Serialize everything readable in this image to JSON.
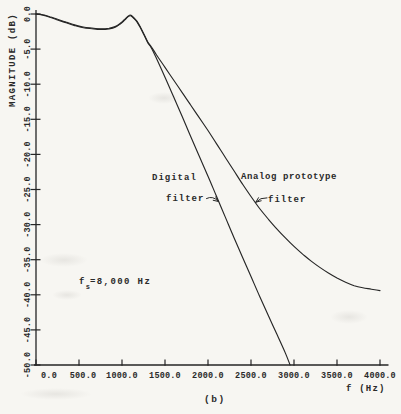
{
  "figure": {
    "caption": "(b)",
    "background": "#f7f6f2",
    "ink": "#262626"
  },
  "chart_data": {
    "type": "line",
    "title": "",
    "xlabel": "f (Hz)",
    "ylabel": "MAGNITUDE (dB)",
    "xlim": [
      0,
      4000
    ],
    "ylim": [
      -50,
      0
    ],
    "grid": false,
    "legend_position": "none",
    "x_ticks": [
      0,
      500,
      1000,
      1500,
      2000,
      2500,
      3000,
      3500,
      4000
    ],
    "x_tick_labels": [
      "0.0",
      "500.0",
      "1000.0",
      "1500.0",
      "2000.0",
      "2500.0",
      "3000.0",
      "3500.0",
      "4000.0"
    ],
    "y_ticks": [
      0,
      -5,
      -10,
      -15,
      -20,
      -25,
      -30,
      -35,
      -40,
      -45,
      -50
    ],
    "y_tick_labels": [
      "0.0",
      "-5.0",
      "-10.0",
      "-15.0",
      "-20.0",
      "-25.0",
      "-30.0",
      "-35.0",
      "-40.0",
      "-45.0",
      "-50.0"
    ],
    "sampling_label": {
      "pre": "f",
      "sub": "s",
      "post": "=8,000 Hz"
    },
    "annotations": {
      "digital_lines": [
        "Digital",
        "filter"
      ],
      "analog_lines": [
        "Analog prototype",
        "filter"
      ]
    },
    "series": [
      {
        "name": "Digital filter",
        "points": [
          [
            0,
            0
          ],
          [
            80,
            -0.15
          ],
          [
            160,
            -0.45
          ],
          [
            250,
            -0.85
          ],
          [
            350,
            -1.25
          ],
          [
            450,
            -1.65
          ],
          [
            550,
            -1.95
          ],
          [
            650,
            -2.1
          ],
          [
            750,
            -2.2
          ],
          [
            850,
            -2.12
          ],
          [
            920,
            -1.9
          ],
          [
            980,
            -1.42
          ],
          [
            1030,
            -0.88
          ],
          [
            1070,
            -0.4
          ],
          [
            1100,
            -0.25
          ],
          [
            1135,
            -0.6
          ],
          [
            1175,
            -1.15
          ],
          [
            1215,
            -2.0
          ],
          [
            1260,
            -3.1
          ],
          [
            1300,
            -4.1
          ],
          [
            1340,
            -4.8
          ],
          [
            1400,
            -6.3
          ],
          [
            1500,
            -9.0
          ],
          [
            1600,
            -11.8
          ],
          [
            1700,
            -14.6
          ],
          [
            1800,
            -17.5
          ],
          [
            1900,
            -20.3
          ],
          [
            2000,
            -23.1
          ],
          [
            2100,
            -26.0
          ],
          [
            2200,
            -28.9
          ],
          [
            2300,
            -31.8
          ],
          [
            2400,
            -34.6
          ],
          [
            2500,
            -37.4
          ],
          [
            2600,
            -40.2
          ],
          [
            2700,
            -42.9
          ],
          [
            2800,
            -45.6
          ],
          [
            2900,
            -48.3
          ],
          [
            2955,
            -50.0
          ]
        ]
      },
      {
        "name": "Analog prototype filter",
        "points": [
          [
            0,
            0
          ],
          [
            80,
            -0.1
          ],
          [
            160,
            -0.38
          ],
          [
            250,
            -0.75
          ],
          [
            350,
            -1.15
          ],
          [
            450,
            -1.55
          ],
          [
            550,
            -1.85
          ],
          [
            650,
            -2.0
          ],
          [
            750,
            -2.1
          ],
          [
            850,
            -2.02
          ],
          [
            920,
            -1.8
          ],
          [
            980,
            -1.32
          ],
          [
            1030,
            -0.78
          ],
          [
            1070,
            -0.32
          ],
          [
            1100,
            -0.15
          ],
          [
            1135,
            -0.5
          ],
          [
            1175,
            -1.05
          ],
          [
            1215,
            -1.9
          ],
          [
            1260,
            -3.0
          ],
          [
            1300,
            -4.0
          ],
          [
            1340,
            -4.65
          ],
          [
            1400,
            -5.8
          ],
          [
            1500,
            -7.6
          ],
          [
            1600,
            -9.4
          ],
          [
            1700,
            -11.2
          ],
          [
            1800,
            -13.0
          ],
          [
            1900,
            -14.8
          ],
          [
            2000,
            -16.6
          ],
          [
            2100,
            -18.5
          ],
          [
            2200,
            -20.4
          ],
          [
            2300,
            -22.3
          ],
          [
            2400,
            -24.2
          ],
          [
            2500,
            -26.0
          ],
          [
            2600,
            -27.7
          ],
          [
            2700,
            -29.2
          ],
          [
            2800,
            -30.6
          ],
          [
            2900,
            -31.9
          ],
          [
            3000,
            -33.1
          ],
          [
            3100,
            -34.2
          ],
          [
            3200,
            -35.2
          ],
          [
            3300,
            -36.1
          ],
          [
            3400,
            -36.9
          ],
          [
            3500,
            -37.6
          ],
          [
            3600,
            -38.2
          ],
          [
            3700,
            -38.7
          ],
          [
            3800,
            -39.0
          ],
          [
            3900,
            -39.2
          ],
          [
            4000,
            -39.4
          ]
        ]
      }
    ]
  }
}
